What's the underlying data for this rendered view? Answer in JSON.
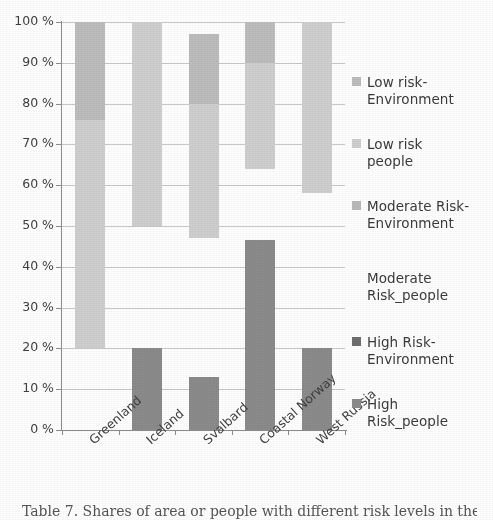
{
  "figure": {
    "caption": "Table 7. Shares of area or people with different risk levels in the various regions"
  },
  "axes": {
    "y_ticks": [
      "100 %",
      "90 %",
      "80 %",
      "70 %",
      "60 %",
      "50 %",
      "40 %",
      "30 %",
      "20 %",
      "10 %",
      "0 %"
    ],
    "x_categories": [
      "Greenland",
      "Iceland",
      "Svalbard",
      "Coastal Norway",
      "West Russia"
    ]
  },
  "legend": {
    "items": [
      {
        "label": "Low risk-\nEnvironment",
        "color": "#bdbdbd",
        "swatch": "filled"
      },
      {
        "label": "Low risk\npeople",
        "color": "#cfcfcf",
        "swatch": "filled"
      },
      {
        "label": "Moderate Risk-\nEnvironment",
        "color": "#b9b9b9",
        "swatch": "filled"
      },
      {
        "label": "Moderate\nRisk_people",
        "color": "#ffffff",
        "swatch": "empty"
      },
      {
        "label": "High Risk-\nEnvironment",
        "color": "#6f6f6f",
        "swatch": "filled"
      },
      {
        "label": "High\nRisk_people",
        "color": "#8b8b8b",
        "swatch": "filled"
      }
    ]
  },
  "chart_data": {
    "type": "bar",
    "title": "",
    "subtitle": "",
    "xlabel": "",
    "ylabel": "",
    "ylim": [
      0,
      100
    ],
    "ytick_step": 10,
    "ytick_format": "percent",
    "grid": true,
    "stacked": true,
    "legend_position": "right",
    "categories": [
      "Greenland",
      "Iceland",
      "Svalbard",
      "Coastal Norway",
      "West Russia"
    ],
    "series": [
      {
        "name": "High Risk_people",
        "color": "#8b8b8b",
        "values": [
          0,
          20,
          13,
          46.5,
          20
        ]
      },
      {
        "name": "Moderate Risk_people",
        "color": "#ffffff",
        "values": [
          20,
          30,
          34,
          17.5,
          38
        ]
      },
      {
        "name": "Low risk people",
        "color": "#cfcfcf",
        "values": [
          56,
          50,
          33,
          26,
          42
        ]
      },
      {
        "name": "Low risk-Environment",
        "color": "#bdbdbd",
        "values": [
          24,
          0,
          17,
          10,
          0
        ]
      }
    ],
    "segment_boundaries_percent": {
      "Greenland": [
        0,
        0,
        20,
        76,
        100
      ],
      "Iceland": [
        0,
        20,
        50,
        100,
        100
      ],
      "Svalbard": [
        0,
        13,
        47,
        80,
        100
      ],
      "Coastal Norway": [
        0,
        46.5,
        64,
        90,
        100
      ],
      "West Russia": [
        0,
        20,
        58,
        100,
        100
      ]
    }
  }
}
